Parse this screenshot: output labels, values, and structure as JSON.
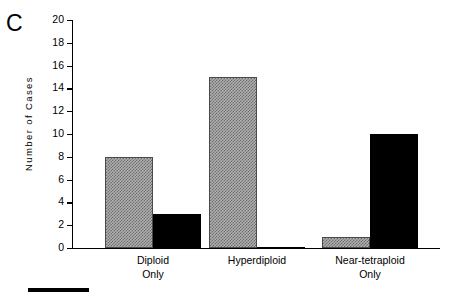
{
  "figure": {
    "panel_letter": "C",
    "scale_rule": "black-scale-bar"
  },
  "chart_data": {
    "type": "bar",
    "title": "",
    "xlabel": "",
    "ylabel": "Number of Cases",
    "ylim": [
      0,
      20
    ],
    "yticks": [
      0,
      2,
      4,
      6,
      8,
      10,
      12,
      14,
      16,
      18,
      20
    ],
    "grid": false,
    "legend": "none",
    "categories": [
      "Diploid Only",
      "Hyperdiploid",
      "Near-tetraploid Only"
    ],
    "category_lines": [
      [
        "Diploid",
        "Only"
      ],
      [
        "Hyperdiploid",
        ""
      ],
      [
        "Near-tetraploid",
        "Only"
      ]
    ],
    "series": [
      {
        "name": "gray",
        "color": "#b0b0b0",
        "values": [
          8,
          15,
          1
        ]
      },
      {
        "name": "black",
        "color": "#000000",
        "values": [
          3,
          0,
          10
        ]
      }
    ]
  }
}
